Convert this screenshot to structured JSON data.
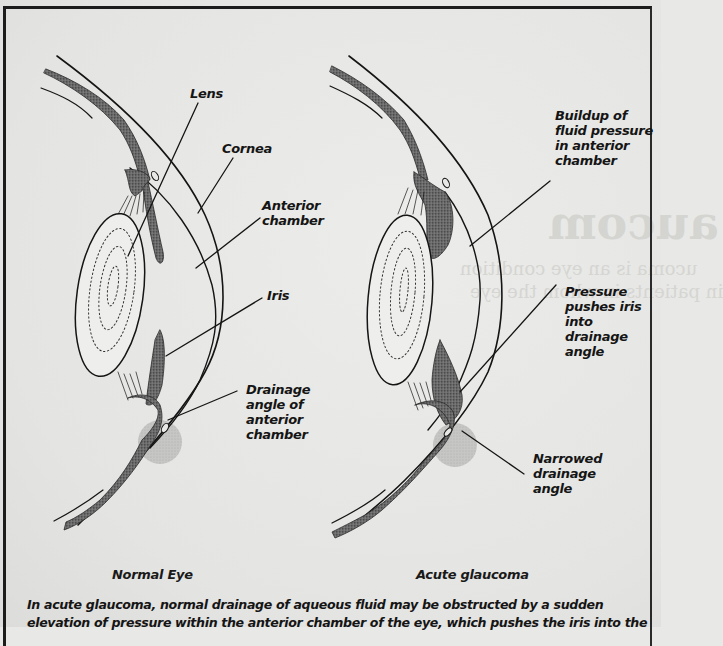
{
  "figure": {
    "panels": [
      {
        "id": "normal",
        "title": "Normal Eye",
        "labels": [
          {
            "key": "lens",
            "text": "Lens"
          },
          {
            "key": "cornea",
            "text": "Cornea"
          },
          {
            "key": "anterior_chamber",
            "text": "Anterior\nchamber"
          },
          {
            "key": "iris",
            "text": "Iris"
          },
          {
            "key": "drainage_angle",
            "text": "Drainage\nangle of\nanterior\nchamber"
          }
        ]
      },
      {
        "id": "acute",
        "title": "Acute glaucoma",
        "labels": [
          {
            "key": "buildup",
            "text": "Buildup of\nfluid pressure\nin anterior\nchamber"
          },
          {
            "key": "pressure",
            "text": "Pressure\npushes iris\ninto\ndrainage\nangle"
          },
          {
            "key": "narrowed",
            "text": "Narrowed\ndrainage\nangle"
          }
        ]
      }
    ],
    "caption": {
      "line1": "In acute glaucoma, normal drainage of aqueous fluid may be obstructed by a sudden",
      "line2": "elevation of pressure within the anterior chamber of the eye, which pushes the iris into the"
    }
  },
  "background_bleed": {
    "heading_fragment": "aucom",
    "line_fragments": [
      "ucoma is an eye condition",
      "in patients in whom the eye"
    ]
  },
  "colors": {
    "ink": "#151515",
    "paper": "#e8e8e6",
    "stipple": "#555555",
    "highlight": "#b8b8b6"
  }
}
